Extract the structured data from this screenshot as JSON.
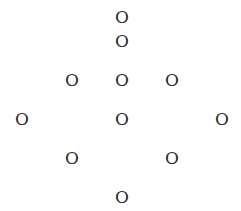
{
  "glyphs": [
    {
      "char": "O",
      "x": 122,
      "y": 17
    },
    {
      "char": "O",
      "x": 122,
      "y": 41
    },
    {
      "char": "O",
      "x": 72,
      "y": 80
    },
    {
      "char": "O",
      "x": 122,
      "y": 80
    },
    {
      "char": "O",
      "x": 172,
      "y": 80
    },
    {
      "char": "O",
      "x": 22,
      "y": 119
    },
    {
      "char": "O",
      "x": 122,
      "y": 119
    },
    {
      "char": "O",
      "x": 222,
      "y": 119
    },
    {
      "char": "O",
      "x": 72,
      "y": 158
    },
    {
      "char": "O",
      "x": 172,
      "y": 158
    },
    {
      "char": "O",
      "x": 122,
      "y": 197
    }
  ],
  "colors": {
    "text": "#2a2a2a",
    "background": "#ffffff"
  }
}
